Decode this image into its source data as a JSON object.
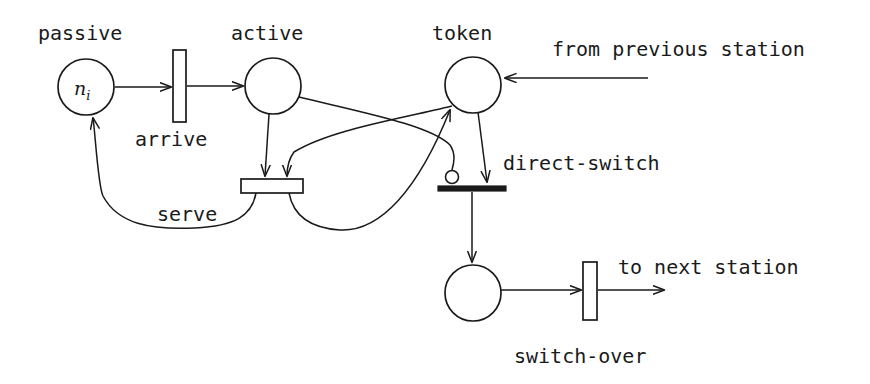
{
  "diagram": {
    "type": "petri-net",
    "background_color": "#ffffff",
    "stroke_color": "#1a1a1a",
    "width": 870,
    "height": 384
  },
  "places": [
    {
      "id": "passive",
      "label": "passive",
      "label_x": 38,
      "label_y": 40,
      "cx": 86,
      "cy": 87,
      "r": 28,
      "marking_text": "n",
      "marking_subscript": "i"
    },
    {
      "id": "active",
      "label": "active",
      "label_x": 231,
      "label_y": 40,
      "cx": 273,
      "cy": 86,
      "r": 28,
      "marking_text": "",
      "marking_subscript": ""
    },
    {
      "id": "token",
      "label": "token",
      "label_x": 432,
      "label_y": 40,
      "cx": 473,
      "cy": 85,
      "r": 28,
      "marking_text": "",
      "marking_subscript": ""
    },
    {
      "id": "switching",
      "label": "",
      "label_x": 0,
      "label_y": 0,
      "cx": 473,
      "cy": 293,
      "r": 28,
      "marking_text": "",
      "marking_subscript": ""
    }
  ],
  "transitions": [
    {
      "id": "arrive",
      "label": "arrive",
      "label_x": 135,
      "label_y": 146,
      "style": "open-vertical",
      "x": 173,
      "y": 50,
      "w": 13,
      "h": 72
    },
    {
      "id": "serve",
      "label": "serve",
      "label_x": 157,
      "label_y": 221,
      "style": "open-horizontal",
      "x": 241,
      "y": 179,
      "w": 62,
      "h": 14
    },
    {
      "id": "direct-switch",
      "label": "direct-switch",
      "label_x": 503,
      "label_y": 170,
      "style": "filled-horizontal",
      "x": 438,
      "y": 186,
      "w": 68,
      "h": 5
    },
    {
      "id": "switch-over",
      "label": "switch-over",
      "label_x": 514,
      "label_y": 363,
      "style": "open-vertical",
      "x": 583,
      "y": 262,
      "w": 14,
      "h": 58
    }
  ],
  "annotations": [
    {
      "id": "from-previous-station",
      "text": "from previous station",
      "x": 552,
      "y": 56
    },
    {
      "id": "to-next-station",
      "text": "to next station",
      "x": 618,
      "y": 274
    }
  ],
  "arcs": [
    {
      "id": "passive-to-arrive",
      "from": "passive",
      "to": "arrive",
      "kind": "normal"
    },
    {
      "id": "arrive-to-active",
      "from": "arrive",
      "to": "active",
      "kind": "normal"
    },
    {
      "id": "active-to-serve",
      "from": "active",
      "to": "serve",
      "kind": "normal"
    },
    {
      "id": "token-to-serve",
      "from": "token",
      "to": "serve",
      "kind": "normal"
    },
    {
      "id": "serve-to-passive",
      "from": "serve",
      "to": "passive",
      "kind": "normal"
    },
    {
      "id": "serve-to-token",
      "from": "serve",
      "to": "token",
      "kind": "normal"
    },
    {
      "id": "previous-station-to-token",
      "from": "external",
      "to": "token",
      "kind": "normal"
    },
    {
      "id": "token-to-direct-switch",
      "from": "token",
      "to": "direct-switch",
      "kind": "normal"
    },
    {
      "id": "active-to-direct-switch",
      "from": "active",
      "to": "direct-switch",
      "kind": "inhibitor"
    },
    {
      "id": "direct-switch-to-switching",
      "from": "direct-switch",
      "to": "switching",
      "kind": "normal"
    },
    {
      "id": "switching-to-switch-over",
      "from": "switching",
      "to": "switch-over",
      "kind": "normal"
    },
    {
      "id": "switch-over-to-next-station",
      "from": "switch-over",
      "to": "external",
      "kind": "normal"
    }
  ]
}
